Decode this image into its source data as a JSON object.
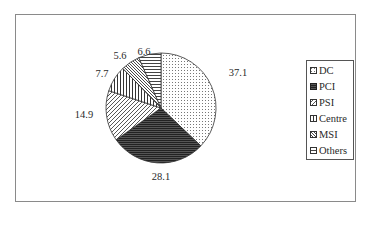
{
  "chart_data": {
    "type": "pie",
    "title": "",
    "categories": [
      "DC",
      "PCI",
      "PSI",
      "Centre",
      "MSI",
      "Others"
    ],
    "values": [
      37.1,
      28.1,
      14.9,
      7.7,
      5.6,
      6.6
    ],
    "labels": [
      "37.1",
      "28.1",
      "14.9",
      "7.7",
      "5.6",
      "6.6"
    ],
    "patterns": [
      "dots",
      "dark-horizontal",
      "diagonal",
      "vertical",
      "reverse-diagonal",
      "horizontal"
    ],
    "start_angle_deg": 0,
    "direction": "clockwise",
    "legend_position": "right",
    "grid": false
  },
  "legend": {
    "items": [
      {
        "label": "DC"
      },
      {
        "label": "PCI"
      },
      {
        "label": "PSI"
      },
      {
        "label": "Centre"
      },
      {
        "label": "MSI"
      },
      {
        "label": "Others"
      }
    ]
  },
  "colors": {
    "frame": "#8a8a8a",
    "slice_outline": "#333333",
    "text": "#2a2a2a"
  }
}
